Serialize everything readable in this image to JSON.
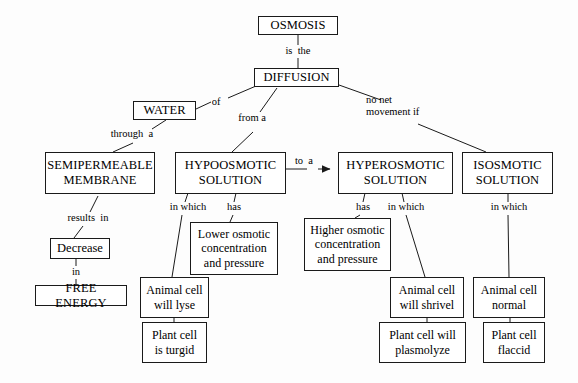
{
  "diagram": {
    "background_color": "#fdfdfd",
    "line_color": "#1a1a1a",
    "text_color": "#000000"
  },
  "nodes": {
    "osmosis": "OSMOSIS",
    "diffusion": "DIFFUSION",
    "water": "WATER",
    "semipermeable_membrane": "SEMIPERMEABLE\nMEMBRANE",
    "hypoosmotic_solution": "HYPOOSMOTIC\nSOLUTION",
    "hyperosmotic_solution": "HYPEROSMOTIC\nSOLUTION",
    "isosmotic_solution": "ISOSMOTIC\nSOLUTION",
    "decrease": "Decrease",
    "free_energy": "FREE ENERGY",
    "lower_osmotic": "Lower osmotic\nconcentration\nand pressure",
    "higher_osmotic": "Higher osmotic\nconcentration\nand pressure",
    "animal_cell_lyse": "Animal cell\nwill lyse",
    "plant_cell_turgid": "Plant cell\nis turgid",
    "animal_cell_shrivel": "Animal cell\nwill shrivel",
    "plant_cell_plasmolyze": "Plant cell will\nplasmolyze",
    "animal_cell_normal": "Animal cell\nnormal",
    "plant_cell_flaccid": "Plant cell\nflaccid"
  },
  "link_labels": {
    "is_the": "is  the",
    "of": "of",
    "from_a": "from a",
    "no_net_movement_if": "no net\nmovement if",
    "through_a": "through  a",
    "results_in": "results  in",
    "in": "in",
    "in_which_hypo": "in which",
    "has_hypo": "has",
    "to_a": "to  a",
    "has_hyper": "has",
    "in_which_hyper": "in which",
    "in_which_iso": "in which"
  },
  "edges": [
    {
      "from": "osmosis",
      "to": "diffusion",
      "label": "is  the"
    },
    {
      "from": "diffusion",
      "to": "water",
      "label": "of"
    },
    {
      "from": "diffusion",
      "to": "hypoosmotic_solution",
      "label": "from a"
    },
    {
      "from": "diffusion",
      "to": "isosmotic_solution",
      "label": "no net movement if"
    },
    {
      "from": "water",
      "to": "semipermeable_membrane",
      "label": "through  a"
    },
    {
      "from": "semipermeable_membrane",
      "to": "decrease",
      "label": "results  in"
    },
    {
      "from": "decrease",
      "to": "free_energy",
      "label": "in"
    },
    {
      "from": "hypoosmotic_solution",
      "to": "animal_cell_lyse",
      "label": "in which"
    },
    {
      "from": "hypoosmotic_solution",
      "to": "lower_osmotic",
      "label": "has"
    },
    {
      "from": "hypoosmotic_solution",
      "to": "hyperosmotic_solution",
      "label": "to  a",
      "arrow": true
    },
    {
      "from": "hyperosmotic_solution",
      "to": "higher_osmotic",
      "label": "has"
    },
    {
      "from": "hyperosmotic_solution",
      "to": "animal_cell_shrivel",
      "label": "in which"
    },
    {
      "from": "isosmotic_solution",
      "to": "animal_cell_normal",
      "label": "in which"
    },
    {
      "from": "animal_cell_lyse",
      "to": "plant_cell_turgid",
      "label": ""
    },
    {
      "from": "animal_cell_shrivel",
      "to": "plant_cell_plasmolyze",
      "label": ""
    },
    {
      "from": "animal_cell_normal",
      "to": "plant_cell_flaccid",
      "label": ""
    }
  ]
}
